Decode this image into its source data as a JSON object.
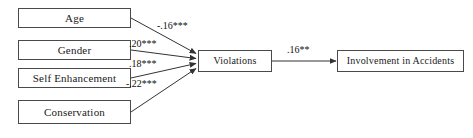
{
  "diagram": {
    "type": "path-diagram",
    "nodes": [
      {
        "id": "age",
        "label": "Age",
        "role": "predictor"
      },
      {
        "id": "gender",
        "label": "Gender",
        "role": "predictor"
      },
      {
        "id": "self_enhancement",
        "label": "Self Enhancement",
        "role": "predictor"
      },
      {
        "id": "conservation",
        "label": "Conservation",
        "role": "predictor"
      },
      {
        "id": "violations",
        "label": "Violations",
        "role": "mediator"
      },
      {
        "id": "accidents",
        "label": "Involvement in Accidents",
        "role": "outcome"
      }
    ],
    "edges": [
      {
        "id": "age-violations",
        "from": "age",
        "to": "violations",
        "coefficient": "-.16",
        "significance": "***",
        "label": "-.16***"
      },
      {
        "id": "gender-violations",
        "from": "gender",
        "to": "violations",
        "coefficient": ".20",
        "significance": "***",
        "label": ".20***"
      },
      {
        "id": "selfenhancement-violations",
        "from": "self_enhancement",
        "to": "violations",
        "coefficient": ".18",
        "significance": "***",
        "label": ".18***"
      },
      {
        "id": "conservation-violations",
        "from": "conservation",
        "to": "violations",
        "coefficient": "-.22",
        "significance": "***",
        "label": "-.22***"
      },
      {
        "id": "violations-accidents",
        "from": "violations",
        "to": "accidents",
        "coefficient": ".16",
        "significance": "**",
        "label": ".16**"
      }
    ],
    "style": {
      "line_color": "#333333",
      "box_border_color": "#4a4a4a",
      "text_color": "#111111",
      "background": "#ffffff"
    }
  }
}
